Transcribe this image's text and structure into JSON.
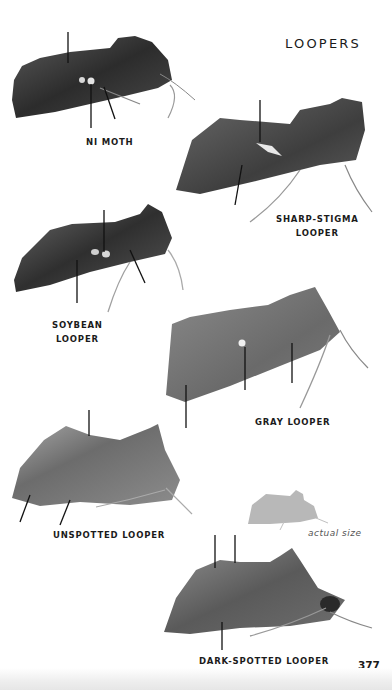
{
  "page": {
    "section_title": "LOOPERS",
    "page_number": "377",
    "colors": {
      "background": "#ffffff",
      "text": "#1b1b1b",
      "silhouette": "#b5b5b5"
    }
  },
  "moths": [
    {
      "id": "ni-moth",
      "label_lines": [
        "NI MOTH"
      ]
    },
    {
      "id": "sharp-stigma-looper",
      "label_lines": [
        "SHARP-STIGMA",
        "LOOPER"
      ]
    },
    {
      "id": "soybean-looper",
      "label_lines": [
        "SOYBEAN",
        "LOOPER"
      ]
    },
    {
      "id": "gray-looper",
      "label_lines": [
        "GRAY LOOPER"
      ]
    },
    {
      "id": "unspotted-looper",
      "label_lines": [
        "UNSPOTTED LOOPER"
      ]
    },
    {
      "id": "dark-spotted-looper",
      "label_lines": [
        "DARK-SPOTTED LOOPER"
      ]
    }
  ],
  "size_reference": {
    "caption": "actual size",
    "icon": "moth-silhouette-icon"
  }
}
